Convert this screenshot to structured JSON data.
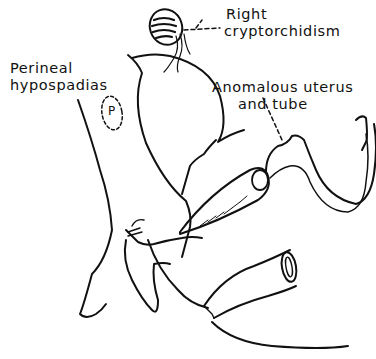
{
  "figure": {
    "labels": {
      "cryptorchidism": [
        "Right",
        "cryptorchidism"
      ],
      "hypospadias": [
        "Perineal",
        "hypospadias"
      ],
      "uterus": [
        "Anomalous uterus",
        "and tube"
      ]
    },
    "marker": "P",
    "ink_color": "#111111",
    "background_color": "#ffffff"
  }
}
